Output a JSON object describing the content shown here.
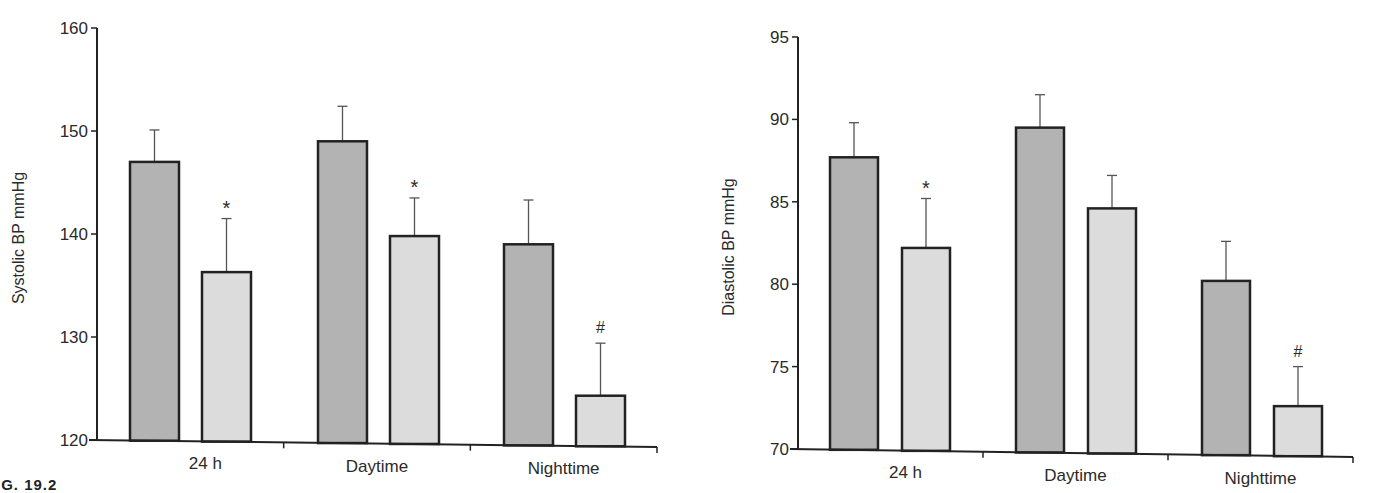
{
  "figure": {
    "caption_fragment": "IG. 19.2"
  },
  "colors": {
    "bar_dark": "#b3b3b3",
    "bar_light": "#dcdcdc",
    "outline": "#222222",
    "error_bar": "#555555",
    "text": "#2a2a2a"
  },
  "chart_data": [
    {
      "type": "bar",
      "title": "",
      "xlabel": "",
      "ylabel": "Systolic BP mmHg",
      "categories": [
        "24 h",
        "Daytime",
        "Nighttime"
      ],
      "ylim": [
        120,
        160
      ],
      "yticks": [
        120,
        130,
        140,
        150,
        160
      ],
      "grid": false,
      "legend": null,
      "series": [
        {
          "name": "Group 1 (dark)",
          "color": "#b3b3b3",
          "values": [
            147.0,
            149.0,
            139.0
          ],
          "error_upper": [
            150.1,
            152.4,
            143.3
          ]
        },
        {
          "name": "Group 2 (light)",
          "color": "#dcdcdc",
          "values": [
            136.3,
            139.8,
            124.3
          ],
          "error_upper": [
            141.5,
            143.5,
            129.4
          ]
        }
      ],
      "annotations": [
        {
          "category": "24 h",
          "series": 1,
          "text": "*"
        },
        {
          "category": "Daytime",
          "series": 1,
          "text": "*"
        },
        {
          "category": "Nighttime",
          "series": 1,
          "text": "#"
        }
      ]
    },
    {
      "type": "bar",
      "title": "",
      "xlabel": "",
      "ylabel": "Diastolic BP mmHg",
      "categories": [
        "24 h",
        "Daytime",
        "Nighttime"
      ],
      "ylim": [
        70,
        95
      ],
      "yticks": [
        70,
        75,
        80,
        85,
        90,
        95
      ],
      "grid": false,
      "legend": null,
      "series": [
        {
          "name": "Group 1 (dark)",
          "color": "#b3b3b3",
          "values": [
            87.7,
            89.5,
            80.2
          ],
          "error_upper": [
            89.8,
            91.5,
            82.6
          ]
        },
        {
          "name": "Group 2 (light)",
          "color": "#dcdcdc",
          "values": [
            82.2,
            84.6,
            72.6
          ],
          "error_upper": [
            85.2,
            86.6,
            75.0
          ]
        }
      ],
      "annotations": [
        {
          "category": "24 h",
          "series": 1,
          "text": "*"
        },
        {
          "category": "Nighttime",
          "series": 1,
          "text": "#"
        }
      ]
    }
  ]
}
